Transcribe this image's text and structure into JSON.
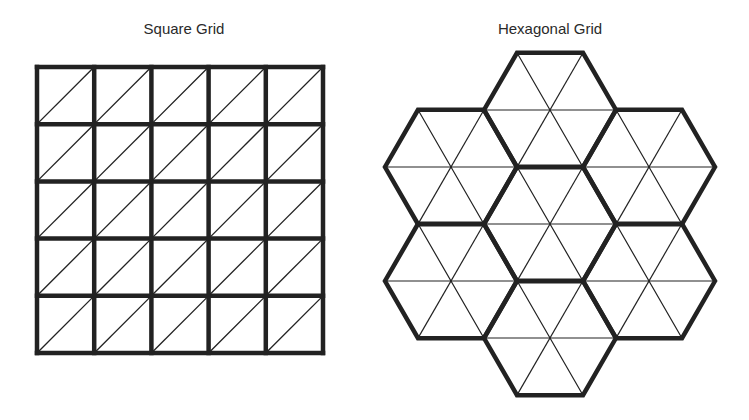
{
  "figures": {
    "square": {
      "title": "Square Grid",
      "rows": 5,
      "cols": 5,
      "origin": [
        37,
        67
      ],
      "cell_size": 57.2,
      "diagonal": "bottom-left to top-right"
    },
    "hex": {
      "title": "Hexagonal Grid",
      "hex_count": 7,
      "side": 66,
      "centers": [
        [
          550,
          110
        ],
        [
          451,
          167
        ],
        [
          649,
          167
        ],
        [
          550,
          224
        ],
        [
          451,
          281
        ],
        [
          649,
          281
        ],
        [
          550,
          338
        ]
      ],
      "subdivision": "6 triangles per hexagon"
    }
  },
  "colors": {
    "stroke": "#222222",
    "background": "#ffffff",
    "text": "#2a2a2a"
  }
}
